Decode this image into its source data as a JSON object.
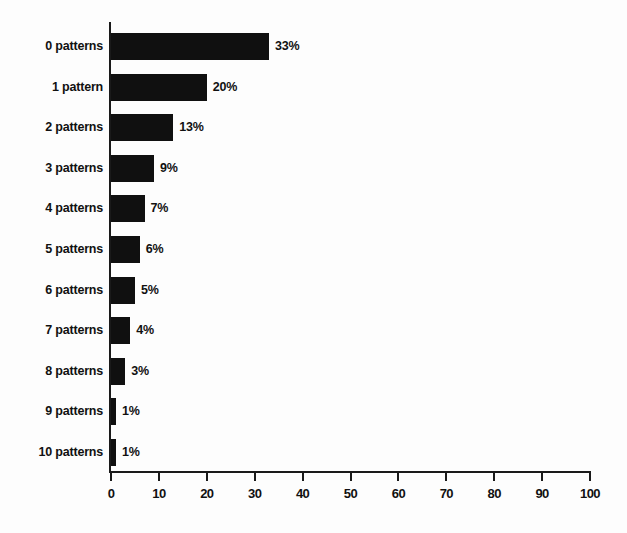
{
  "chart_data": {
    "type": "bar",
    "orientation": "horizontal",
    "title": "",
    "subtitle": "",
    "xlabel": "",
    "ylabel": "",
    "xlim": [
      0,
      100
    ],
    "xticks": [
      0,
      10,
      20,
      30,
      40,
      50,
      60,
      70,
      80,
      90,
      100
    ],
    "xtick_labels": [
      "0",
      "10",
      "20",
      "30",
      "40",
      "50",
      "60",
      "70",
      "80",
      "90",
      "100"
    ],
    "grid": false,
    "legend": null,
    "bar_color": "#101010",
    "axis_color": "#1a1a1a",
    "background": "#fdfdfd",
    "categories": [
      "0 patterns",
      "1 pattern",
      "2 patterns",
      "3 patterns",
      "4 patterns",
      "5 patterns",
      "6 patterns",
      "7 patterns",
      "8 patterns",
      "9 patterns",
      "10 patterns"
    ],
    "values": [
      33,
      20,
      13,
      9,
      7,
      6,
      5,
      4,
      3,
      1,
      1
    ],
    "value_labels": [
      "33%",
      "20%",
      "13%",
      "9%",
      "7%",
      "6%",
      "5%",
      "4%",
      "3%",
      "1%",
      "1%"
    ],
    "bars": [
      {
        "category": "0 patterns",
        "value": 33,
        "label": "33%"
      },
      {
        "category": "1 pattern",
        "value": 20,
        "label": "20%"
      },
      {
        "category": "2 patterns",
        "value": 13,
        "label": "13%"
      },
      {
        "category": "3 patterns",
        "value": 9,
        "label": "9%"
      },
      {
        "category": "4 patterns",
        "value": 7,
        "label": "7%"
      },
      {
        "category": "5 patterns",
        "value": 6,
        "label": "6%"
      },
      {
        "category": "6 patterns",
        "value": 5,
        "label": "5%"
      },
      {
        "category": "7 patterns",
        "value": 4,
        "label": "4%"
      },
      {
        "category": "8 patterns",
        "value": 3,
        "label": "3%"
      },
      {
        "category": "9 patterns",
        "value": 1,
        "label": "1%"
      },
      {
        "category": "10 patterns",
        "value": 1,
        "label": "1%"
      }
    ]
  }
}
